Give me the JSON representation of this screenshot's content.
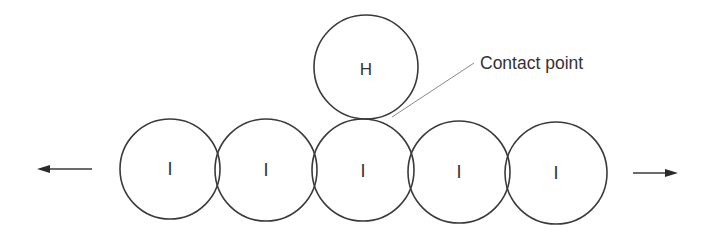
{
  "diagram": {
    "colors": {
      "stroke": "#3a3a3a",
      "text": "#333333",
      "leader": "#8a8a8a",
      "background": "#ffffff"
    },
    "h_circle": {
      "label": "H",
      "cx": 366,
      "cy": 67,
      "r": 52
    },
    "i_circles": [
      {
        "label": "I",
        "cx": 170,
        "cy": 169,
        "r": 50
      },
      {
        "label": "I",
        "cx": 266,
        "cy": 170,
        "r": 51
      },
      {
        "label": "I",
        "cx": 363,
        "cy": 170,
        "r": 51
      },
      {
        "label": "I",
        "cx": 459,
        "cy": 172,
        "r": 51
      },
      {
        "label": "I",
        "cx": 556,
        "cy": 173,
        "r": 51
      }
    ],
    "callout": {
      "text": "Contact point",
      "x": 480,
      "y": 69,
      "leader_from": [
        474,
        63
      ],
      "leader_to": [
        392,
        117
      ]
    },
    "arrows": {
      "left": {
        "direction": "left",
        "x1": 92,
        "x2": 37,
        "y": 169
      },
      "right": {
        "direction": "right",
        "x1": 633,
        "x2": 678,
        "y": 173
      }
    }
  }
}
